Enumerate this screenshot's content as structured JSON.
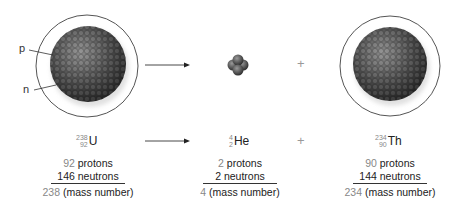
{
  "diagram": {
    "labels": {
      "proton": "p",
      "neutron": "n"
    },
    "operator_plus": "+",
    "reactant": {
      "element": "U",
      "mass_number": "238",
      "atomic_number": "92",
      "protons_count": "92",
      "protons_label": "protons",
      "neutrons_count": "146",
      "neutrons_label": "neutrons",
      "mass_value": "238",
      "mass_label": "(mass number)"
    },
    "product_alpha": {
      "element": "He",
      "mass_number": "4",
      "atomic_number": "2",
      "protons_count": "2",
      "protons_label": "protons",
      "neutrons_count": "2",
      "neutrons_label": "neutrons",
      "mass_value": "4",
      "mass_label": "(mass number)"
    },
    "product_daughter": {
      "element": "Th",
      "mass_number": "234",
      "atomic_number": "90",
      "protons_count": "90",
      "protons_label": "protons",
      "neutrons_count": "144",
      "neutrons_label": "neutrons",
      "mass_value": "234",
      "mass_label": "(mass number)"
    },
    "colors": {
      "nucleus": "#4a4a4a",
      "shell_outline": "#555555",
      "arrow": "#333333",
      "number_gray": "#888888"
    }
  }
}
